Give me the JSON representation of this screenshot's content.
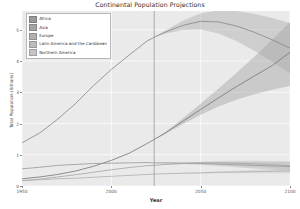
{
  "chart_data": {
    "type": "line",
    "title": "Continental Population Projections",
    "xlabel": "Year",
    "ylabel": "Total Population (Billions)",
    "xlim": [
      1950,
      2100
    ],
    "ylim": [
      0,
      5.6
    ],
    "xticks": [
      1950,
      2000,
      2050,
      2100
    ],
    "xticklabels": [
      "1950",
      "2000",
      "2050",
      "2100"
    ],
    "yticks": [
      0,
      1,
      2,
      3,
      4,
      5
    ],
    "yticklabels": [
      "0",
      "1",
      "2",
      "3",
      "4",
      "5"
    ],
    "grid": true,
    "grid_color": "#ffffff",
    "plot_bg": "#eaeaea",
    "legend_position": "upper left",
    "annotations": [
      {
        "type": "vline",
        "x": 2024,
        "label": "current year"
      }
    ],
    "x": [
      1950,
      1960,
      1970,
      1980,
      1990,
      2000,
      2010,
      2020,
      2024,
      2030,
      2040,
      2050,
      2060,
      2070,
      2080,
      2090,
      2100
    ],
    "series": [
      {
        "name": "Africa",
        "color": "#7b7b7b",
        "band_color": "#9a9a9a",
        "values": [
          0.23,
          0.29,
          0.37,
          0.48,
          0.63,
          0.82,
          1.05,
          1.36,
          1.49,
          1.69,
          2.07,
          2.45,
          2.82,
          3.18,
          3.52,
          3.85,
          4.28
        ],
        "band_low": [
          0.23,
          0.29,
          0.37,
          0.48,
          0.63,
          0.82,
          1.05,
          1.36,
          1.49,
          1.66,
          1.98,
          2.28,
          2.54,
          2.76,
          2.94,
          3.08,
          3.2
        ],
        "band_high": [
          0.23,
          0.29,
          0.37,
          0.48,
          0.63,
          0.82,
          1.05,
          1.36,
          1.49,
          1.72,
          2.16,
          2.63,
          3.12,
          3.62,
          4.14,
          4.68,
          5.25
        ]
      },
      {
        "name": "Asia",
        "color": "#8a8a8a",
        "band_color": "#a5a5a5",
        "values": [
          1.38,
          1.7,
          2.14,
          2.64,
          3.21,
          3.73,
          4.19,
          4.64,
          4.76,
          4.92,
          5.14,
          5.27,
          5.25,
          5.12,
          4.92,
          4.68,
          4.41
        ],
        "band_low": [
          1.38,
          1.7,
          2.14,
          2.64,
          3.21,
          3.73,
          4.19,
          4.64,
          4.76,
          4.87,
          4.99,
          5.01,
          4.88,
          4.64,
          4.33,
          3.98,
          3.6
        ],
        "band_high": [
          1.38,
          1.7,
          2.14,
          2.64,
          3.21,
          3.73,
          4.19,
          4.64,
          4.76,
          4.97,
          5.29,
          5.53,
          5.62,
          5.6,
          5.51,
          5.38,
          5.22
        ]
      },
      {
        "name": "Europe",
        "color": "#9c9c9c",
        "band_color": "#b0b0b0",
        "values": [
          0.55,
          0.6,
          0.66,
          0.69,
          0.72,
          0.73,
          0.74,
          0.75,
          0.74,
          0.74,
          0.73,
          0.72,
          0.7,
          0.68,
          0.66,
          0.64,
          0.62
        ],
        "band_low": [
          0.55,
          0.6,
          0.66,
          0.69,
          0.72,
          0.73,
          0.74,
          0.75,
          0.74,
          0.73,
          0.71,
          0.68,
          0.64,
          0.6,
          0.56,
          0.52,
          0.48
        ],
        "band_high": [
          0.55,
          0.6,
          0.66,
          0.69,
          0.72,
          0.73,
          0.74,
          0.75,
          0.74,
          0.75,
          0.76,
          0.77,
          0.77,
          0.77,
          0.77,
          0.77,
          0.77
        ]
      },
      {
        "name": "Latin America and the Caribbean",
        "color": "#a8a8a8",
        "band_color": "#bcbcbc",
        "values": [
          0.17,
          0.22,
          0.29,
          0.36,
          0.44,
          0.52,
          0.59,
          0.65,
          0.66,
          0.69,
          0.72,
          0.74,
          0.74,
          0.73,
          0.71,
          0.68,
          0.65
        ],
        "band_low": [
          0.17,
          0.22,
          0.29,
          0.36,
          0.44,
          0.52,
          0.59,
          0.65,
          0.66,
          0.68,
          0.7,
          0.7,
          0.69,
          0.66,
          0.62,
          0.58,
          0.53
        ],
        "band_high": [
          0.17,
          0.22,
          0.29,
          0.36,
          0.44,
          0.52,
          0.59,
          0.65,
          0.66,
          0.7,
          0.74,
          0.78,
          0.8,
          0.81,
          0.81,
          0.8,
          0.79
        ]
      },
      {
        "name": "Northern America",
        "color": "#b2b2b2",
        "band_color": "#c4c4c4",
        "values": [
          0.17,
          0.2,
          0.23,
          0.25,
          0.28,
          0.31,
          0.34,
          0.37,
          0.38,
          0.39,
          0.41,
          0.42,
          0.44,
          0.45,
          0.46,
          0.47,
          0.48
        ],
        "band_low": [
          0.17,
          0.2,
          0.23,
          0.25,
          0.28,
          0.31,
          0.34,
          0.37,
          0.38,
          0.39,
          0.4,
          0.4,
          0.41,
          0.41,
          0.41,
          0.41,
          0.4
        ],
        "band_high": [
          0.17,
          0.2,
          0.23,
          0.25,
          0.28,
          0.31,
          0.34,
          0.37,
          0.38,
          0.4,
          0.42,
          0.44,
          0.47,
          0.49,
          0.52,
          0.54,
          0.57
        ]
      }
    ]
  }
}
